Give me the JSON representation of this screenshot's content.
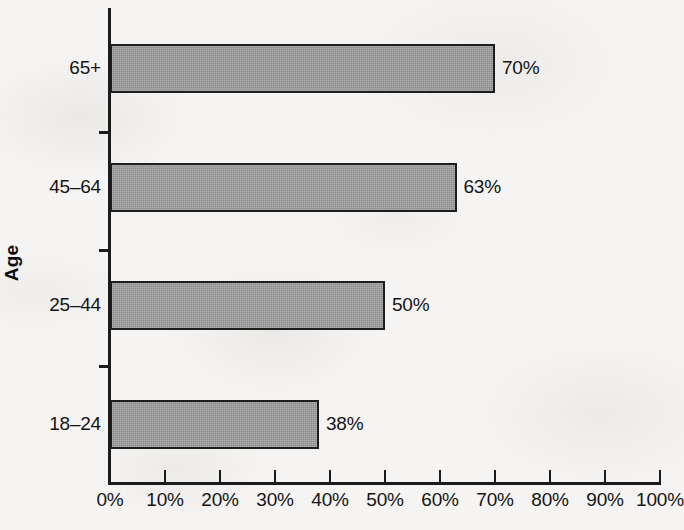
{
  "chart_data": {
    "type": "bar",
    "orientation": "horizontal",
    "title": "",
    "xlabel": "",
    "ylabel": "Age",
    "categories": [
      "18–24",
      "25–44",
      "45–64",
      "65+"
    ],
    "values": [
      38,
      50,
      63,
      70
    ],
    "value_labels": [
      "38%",
      "50%",
      "63%",
      "70%"
    ],
    "xlim": [
      0,
      100
    ],
    "xticks": [
      0,
      10,
      20,
      30,
      40,
      50,
      60,
      70,
      80,
      90,
      100
    ],
    "xtick_labels": [
      "0%",
      "10%",
      "20%",
      "30%",
      "40%",
      "50%",
      "60%",
      "70%",
      "80%",
      "90%",
      "100%"
    ],
    "grid": false,
    "legend": false,
    "bar_fill_color": "#9c9c9c",
    "bar_edge_color": "#1d1d1d",
    "axis_color": "#1b1b1b",
    "text_color": "#141414",
    "background_color": "#f5f4f2"
  },
  "axis": {
    "y_title": "Age"
  },
  "bars": [
    {
      "category": "65+",
      "value": 70,
      "label": "70%"
    },
    {
      "category": "45–64",
      "value": 63,
      "label": "63%"
    },
    {
      "category": "25–44",
      "value": 50,
      "label": "50%"
    },
    {
      "category": "18–24",
      "value": 38,
      "label": "38%"
    }
  ],
  "xticks": [
    {
      "value": 0,
      "label": "0%"
    },
    {
      "value": 10,
      "label": "10%"
    },
    {
      "value": 20,
      "label": "20%"
    },
    {
      "value": 30,
      "label": "30%"
    },
    {
      "value": 40,
      "label": "40%"
    },
    {
      "value": 50,
      "label": "50%"
    },
    {
      "value": 60,
      "label": "60%"
    },
    {
      "value": 70,
      "label": "70%"
    },
    {
      "value": 80,
      "label": "80%"
    },
    {
      "value": 90,
      "label": "90%"
    },
    {
      "value": 100,
      "label": "100%"
    }
  ],
  "layout": {
    "plot_left": 110,
    "plot_right": 660,
    "axis_y": 482,
    "bar_height": 49,
    "bar_tops": [
      44,
      163,
      281,
      400
    ],
    "minor_tick_ys": [
      131,
      249,
      365
    ]
  }
}
